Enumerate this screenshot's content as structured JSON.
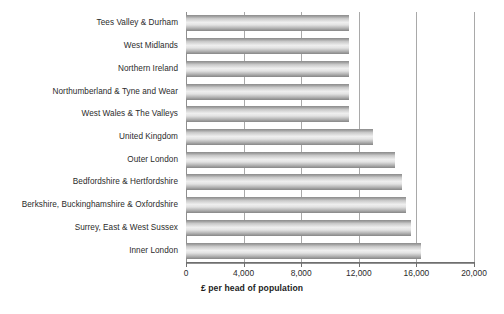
{
  "chart_data": {
    "type": "bar",
    "orientation": "horizontal",
    "title": "",
    "xlabel": "£ per head of population",
    "ylabel": "",
    "xlim": [
      0,
      20000
    ],
    "xticks": [
      0,
      4000,
      8000,
      12000,
      16000,
      20000
    ],
    "xtick_labels": [
      "0",
      "4,000",
      "8,000",
      "12,000",
      "16,000",
      "20,000"
    ],
    "grid": true,
    "grid_axis": "x",
    "legend": "none",
    "categories": [
      "Tees Valley & Durham",
      "West Midlands",
      "Northern Ireland",
      "Northumberland & Tyne and Wear",
      "West Wales & The Valleys",
      "United Kingdom",
      "Outer London",
      "Bedfordshire & Hertfordshire",
      "Berkshire, Buckinghamshire & Oxfordshire",
      "Surrey, East & West Sussex",
      "Inner London"
    ],
    "values": [
      11300,
      11300,
      11300,
      11300,
      11300,
      13000,
      14500,
      15000,
      15300,
      15600,
      16300
    ],
    "bar_color": "#b8b8b8",
    "bar_edge_color": "#8d8d8d",
    "axis_color": "#6f6f6f",
    "gridline_color": "#a9a9a9",
    "background_color": "#ffffff"
  }
}
